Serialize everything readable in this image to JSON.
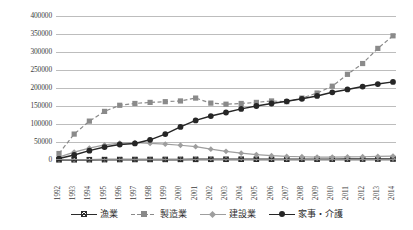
{
  "chart_data": {
    "type": "line",
    "title": "",
    "xlabel": "",
    "ylabel": "",
    "ylim": [
      0,
      400000
    ],
    "ytick_step": 50000,
    "grid": true,
    "legend_position": "bottom",
    "yticks": [
      "400000",
      "350000",
      "300000",
      "250000",
      "200000",
      "150000",
      "100000",
      "50000",
      "0"
    ],
    "categories": [
      "1992",
      "1993",
      "1994",
      "1995",
      "1996",
      "1997",
      "1998",
      "1999",
      "2000",
      "2001",
      "2002",
      "2003",
      "2004",
      "2005",
      "2006",
      "2007",
      "2008",
      "2009",
      "2010",
      "2011",
      "2012",
      "2013",
      "2014"
    ],
    "series": [
      {
        "name": "漁業",
        "color": "#2b2b2b",
        "marker": "x-square",
        "dash": "solid",
        "values": [
          600,
          700,
          900,
          1100,
          1300,
          1400,
          1500,
          1600,
          1700,
          1800,
          1900,
          2000,
          2100,
          2100,
          2200,
          2200,
          2300,
          2300,
          2400,
          2500,
          2600,
          2700,
          2800
        ]
      },
      {
        "name": "製造業",
        "color": "#8a8a8a",
        "marker": "square",
        "dash": "dashed",
        "values": [
          18000,
          72000,
          108000,
          135000,
          152000,
          157000,
          160000,
          162000,
          164000,
          172000,
          158000,
          155000,
          157000,
          160000,
          164000,
          162000,
          172000,
          186000,
          205000,
          238000,
          268000,
          310000,
          345000
        ]
      },
      {
        "name": "建設業",
        "color": "#9e9e9e",
        "marker": "diamond",
        "dash": "solid",
        "values": [
          8000,
          22000,
          33000,
          42000,
          47000,
          48000,
          46000,
          44000,
          41000,
          37000,
          30000,
          24000,
          19000,
          15000,
          12000,
          10000,
          9000,
          8000,
          8000,
          8500,
          9000,
          10000,
          11000
        ]
      },
      {
        "name": "家事・介護",
        "color": "#262626",
        "marker": "circle",
        "dash": "solid",
        "values": [
          4000,
          14000,
          26000,
          36000,
          43000,
          46000,
          56000,
          72000,
          92000,
          110000,
          122000,
          132000,
          142000,
          150000,
          157000,
          163000,
          170000,
          178000,
          188000,
          196000,
          204000,
          211000,
          217000
        ]
      }
    ]
  }
}
